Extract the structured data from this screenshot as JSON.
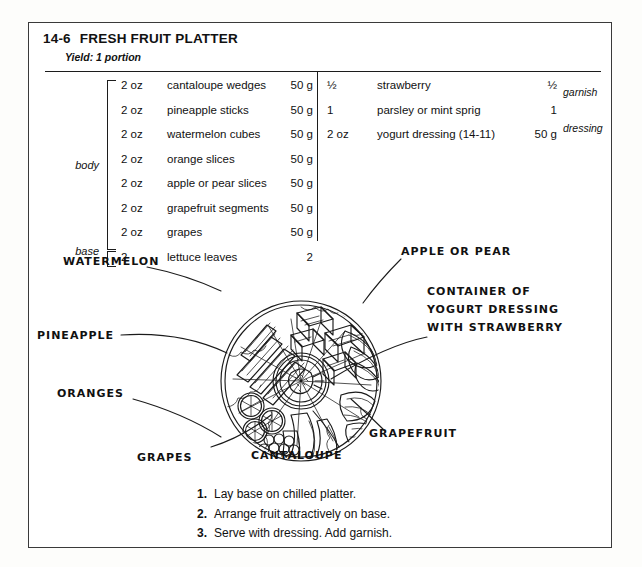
{
  "recipe": {
    "number": "14-6",
    "title": "FRESH FRUIT PLATTER",
    "yield": "Yield: 1 portion"
  },
  "table": {
    "body_label": "body",
    "base_label": "base",
    "garnish_label": "garnish",
    "dressing_label": "dressing",
    "left_rows": [
      {
        "qty": "2 oz",
        "name": "cantaloupe wedges",
        "metric": "50 g"
      },
      {
        "qty": "2 oz",
        "name": "pineapple sticks",
        "metric": "50 g"
      },
      {
        "qty": "2 oz",
        "name": "watermelon cubes",
        "metric": "50 g"
      },
      {
        "qty": "2 oz",
        "name": "orange slices",
        "metric": "50 g"
      },
      {
        "qty": "2 oz",
        "name": "apple or pear slices",
        "metric": "50 g"
      },
      {
        "qty": "2 oz",
        "name": "grapefruit segments",
        "metric": "50 g"
      },
      {
        "qty": "2 oz",
        "name": "grapes",
        "metric": "50 g"
      },
      {
        "qty": "2",
        "name": "lettuce leaves",
        "metric": "2"
      }
    ],
    "right_rows": [
      {
        "qty": "½",
        "name": "strawberry",
        "metric": "½"
      },
      {
        "qty": "1",
        "name": "parsley or mint sprig",
        "metric": "1"
      },
      {
        "qty": "2 oz",
        "name": "yogurt dressing (14-11)",
        "metric": "50 g"
      }
    ]
  },
  "illustration": {
    "labels": {
      "watermelon": "WATERMELON",
      "pineapple": "PINEAPPLE",
      "oranges": "ORANGES",
      "grapes": "GRAPES",
      "cantaloupe": "CANTALOUPE",
      "grapefruit": "GRAPEFRUIT",
      "apple_or_pear": "APPLE OR PEAR",
      "container_line1": "CONTAINER OF",
      "container_line2": "YOGURT DRESSING",
      "container_line3": "WITH STRAWBERRY"
    }
  },
  "instructions": [
    {
      "num": "1.",
      "text": "Lay base on chilled platter."
    },
    {
      "num": "2.",
      "text": "Arrange fruit attractively on base."
    },
    {
      "num": "3.",
      "text": "Serve with dressing. Add garnish."
    }
  ]
}
